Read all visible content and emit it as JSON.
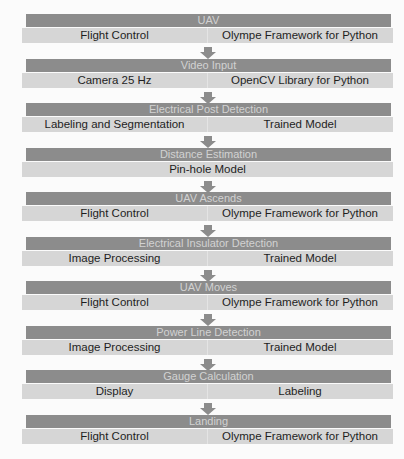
{
  "steps": [
    {
      "title": "UAV",
      "left": "Flight Control",
      "right": "Olympe Framework for Python"
    },
    {
      "title": "Video Input",
      "left": "Camera 25 Hz",
      "right": "OpenCV Library for Python"
    },
    {
      "title": "Electrical Post Detection",
      "left": "Labeling and Segmentation",
      "right": "Trained Model"
    },
    {
      "title": "Distance Estimation",
      "center": "Pin-hole Model"
    },
    {
      "title": "UAV Ascends",
      "left": "Flight Control",
      "right": "Olympe Framework for Python"
    },
    {
      "title": "Electrical Insulator Detection",
      "left": "Image Processing",
      "right": "Trained Model"
    },
    {
      "title": "UAV Moves",
      "left": "Flight Control",
      "right": "Olympe Framework for Python"
    },
    {
      "title": "Power Line Detection",
      "left": "Image Processing",
      "right": "Trained Model"
    },
    {
      "title": "Gauge Calculation",
      "left": "Display",
      "right": "Labeling"
    },
    {
      "title": "Landing",
      "left": "Flight Control",
      "right": "Olympe Framework for Python"
    }
  ],
  "colors": {
    "header": "#8c8c8c",
    "body": "#d6d6d6",
    "arrow": "#8c8c8c"
  },
  "icons": {
    "connector": "arrow-down-icon"
  }
}
